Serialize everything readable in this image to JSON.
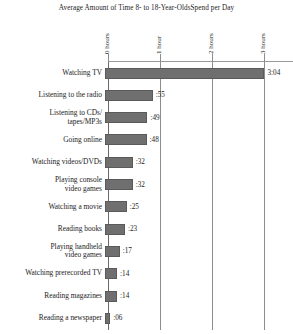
{
  "chart_data": {
    "type": "bar",
    "orientation": "horizontal",
    "title": "Average Amount of Time 8- to 18-Year-OldsSpend per Day",
    "xlabel": "",
    "ylabel": "",
    "xlim": [
      0,
      3.5
    ],
    "grid": true,
    "legend": "none",
    "x_tick_labels": [
      "0 hours",
      "1 hour",
      "2 hours",
      "3 hours",
      "4 hours"
    ],
    "x_tick_values": [
      0,
      1,
      2,
      3,
      4
    ],
    "units": "hours:minutes per day",
    "categories": [
      "Watching TV",
      "Listening to the radio",
      "Listening to CDs/\ntapes/MP3s",
      "Going online",
      "Watching videos/DVDs",
      "Playing console\nvideo games",
      "Watching a movie",
      "Reading books",
      "Playing handheld\nvideo games",
      "Watching prerecorded TV",
      "Reading magazines",
      "Reading a newspaper"
    ],
    "value_labels": [
      "3:04",
      ":55",
      ":49",
      ":48",
      ":32",
      ":32",
      ":25",
      ":23",
      ":17",
      ":14",
      ":14",
      ":06"
    ],
    "values_minutes": [
      184,
      55,
      49,
      48,
      32,
      32,
      25,
      23,
      17,
      14,
      14,
      6
    ],
    "values_hours": [
      3.067,
      0.917,
      0.817,
      0.8,
      0.533,
      0.533,
      0.417,
      0.383,
      0.283,
      0.233,
      0.233,
      0.1
    ]
  },
  "style": {
    "bar_color": "#6f6f6f",
    "bar_border_color": "#5a5a5a",
    "gridline_color": "#8d8d8d",
    "text_color": "#1c1c1c",
    "background": "#ffffff"
  }
}
